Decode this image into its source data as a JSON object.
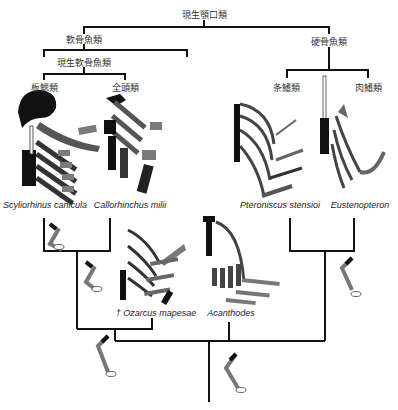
{
  "title": "現生顎口類",
  "clades": {
    "gnathostomes": "現生顎口類",
    "chondrichthyes": "軟骨魚類",
    "osteichthyes": "硬骨魚類",
    "crown_chondrichthyes": "現生軟骨魚類",
    "elasmobranchii": "板鰓類",
    "holocephali": "全頭類",
    "actinopterygii": "条鰭類",
    "sarcopterygii": "肉鰭類"
  },
  "taxa": {
    "scyliorhinus": "Scyliorhinus canicula",
    "callorhinchus": "Callorhinchus milii",
    "pteroniscus": "Pteroniscus stensioi",
    "eusthenopteron": "Eustenopteron",
    "ozarcus": "† Ozarcus mapesae",
    "acanthodes": "Acanthodes"
  },
  "colors": {
    "line": "#111111",
    "dark": "#1a1a1a",
    "mid": "#555555",
    "grey": "#7a7a7a",
    "light": "#ffffff"
  }
}
